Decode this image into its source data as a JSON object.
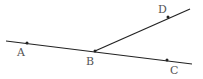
{
  "diagram": {
    "type": "geometry",
    "colors": {
      "line": "#222222",
      "label": "#555555",
      "background": "#ffffff"
    },
    "points": [
      {
        "id": "A",
        "label": "A",
        "x": 27,
        "y": 43,
        "label_x": 17,
        "label_y": 56
      },
      {
        "id": "B",
        "label": "B",
        "x": 95,
        "y": 51,
        "label_x": 86,
        "label_y": 65
      },
      {
        "id": "C",
        "label": "C",
        "x": 167,
        "y": 60,
        "label_x": 170,
        "label_y": 74
      },
      {
        "id": "D",
        "label": "D",
        "x": 168,
        "y": 17,
        "label_x": 158,
        "label_y": 13
      }
    ],
    "segments": [
      {
        "id": "line-AC",
        "x1": 6,
        "y1": 41,
        "x2": 192,
        "y2": 64
      },
      {
        "id": "ray-BD",
        "x1": 95,
        "y1": 51,
        "x2": 190,
        "y2": 9
      }
    ]
  }
}
